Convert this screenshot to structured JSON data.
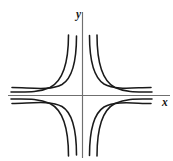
{
  "figure": {
    "background_color": "#ffffff",
    "width": 173,
    "height": 161
  },
  "axes": {
    "x_label": "x",
    "y_label": "y",
    "axis_color": "#6f6f6f",
    "origin": {
      "x": 82.5,
      "y": 95.5
    },
    "x_axis": {
      "x1": 8,
      "y1": 95.5,
      "x2": 170,
      "y2": 95.5
    },
    "y_axis": {
      "x1": 82.5,
      "y1": 12,
      "x2": 82.5,
      "y2": 158
    },
    "x_label_pos": {
      "x": 162,
      "y": 103
    },
    "y_label_pos": {
      "x": 76,
      "y": 15
    }
  },
  "chart_data": {
    "type": "line",
    "xlabel": "x",
    "ylabel": "y",
    "grid": false,
    "legend": false,
    "curve_color": "#1a1a1a",
    "series": [
      {
        "name": "quadrant-II-inner",
        "quadrant": "II",
        "path": "M 76.5 36 C 76.5 60, 73 78, 62 84.5 C 50 91, 30 87.5, 12 87.5"
      },
      {
        "name": "quadrant-II-outer",
        "quadrant": "II",
        "path": "M 68.5 35 C 68.5 63, 63 81, 50 87.5 C 38 93, 26 92, 11 92"
      },
      {
        "name": "quadrant-I-inner",
        "quadrant": "I",
        "path": "M 89.5 35.5 C 89.5 59, 93 77, 104 84 C 116 90.5, 134 87.5, 151 87.5"
      },
      {
        "name": "quadrant-I-outer",
        "quadrant": "I",
        "path": "M 97 35 C 97 63, 102 81, 115 87.5 C 127 93, 138 92, 152 92"
      },
      {
        "name": "quadrant-III-inner",
        "quadrant": "III",
        "path": "M 76.5 155 C 76.5 131, 73 113, 62 106.5 C 50 100, 30 103.5, 12 103.5"
      },
      {
        "name": "quadrant-III-outer",
        "quadrant": "III",
        "path": "M 68.5 156 C 68.5 128, 63 110, 50 103.5 C 38 98, 26 99, 11 99"
      },
      {
        "name": "quadrant-IV-inner",
        "quadrant": "IV",
        "path": "M 89.5 155.5 C 89.5 132, 93 114, 104 107 C 116 100.5, 134 103.5, 151 103.5"
      },
      {
        "name": "quadrant-IV-outer",
        "quadrant": "IV",
        "path": "M 97 156 C 97 128, 102 110, 115 103.5 C 127 98, 138 99, 152 99"
      }
    ]
  }
}
